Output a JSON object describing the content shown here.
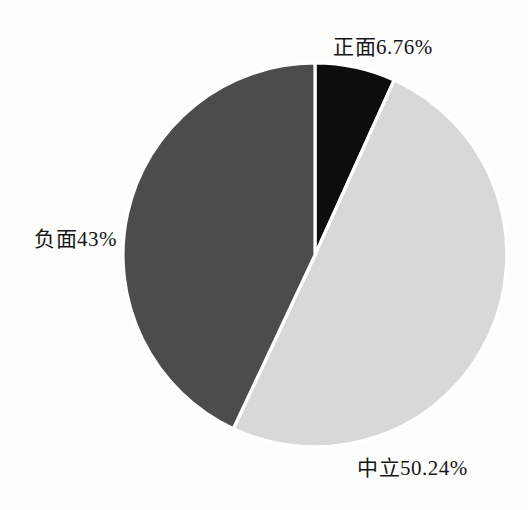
{
  "chart_data": {
    "type": "pie",
    "slices": [
      {
        "name": "正面",
        "value": 6.76,
        "display": "正面6.76%",
        "color": "#0d0d0d"
      },
      {
        "name": "中立",
        "value": 50.24,
        "display": "中立50.24%",
        "color": "#d8d8d8"
      },
      {
        "name": "负面",
        "value": 43,
        "display": "负面43%",
        "color": "#4c4c4c"
      }
    ],
    "unit": "%",
    "start_angle_deg": -90,
    "direction": "clockwise",
    "separator_color": "#ffffff",
    "label_position": "outside",
    "legend": "none",
    "title": ""
  },
  "colors": {
    "background": "#fdfdfc",
    "text": "#161616"
  }
}
